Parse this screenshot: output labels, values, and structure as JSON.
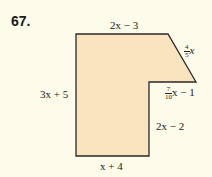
{
  "problem_number": "67.",
  "shape": {
    "fill": "#fae3bf",
    "stroke": "#2a2a2a",
    "points": "76,34 168,34 196,82 149,82 149,156 76,156"
  },
  "labels": {
    "top": "2x − 3",
    "diagonal_num": "4",
    "diagonal_den": "5",
    "diagonal_var": "x",
    "step_num": "7",
    "step_den": "10",
    "step_rest": "x − 1",
    "left": "3x + 5",
    "inner_right": "2x − 2",
    "bottom": "x + 4"
  }
}
